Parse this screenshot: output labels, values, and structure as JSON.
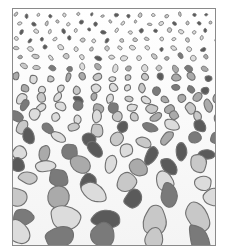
{
  "diagram": {
    "grading": {
      "top": "fine grains",
      "bottom": "coarse pebbles"
    },
    "palette": {
      "light": "#dcdcdc",
      "mid_light": "#c8c8c8",
      "mid": "#aaaaaa",
      "dark": "#7a7a7a",
      "darkest": "#5a5a5a",
      "outline": "#707070",
      "frame": "#8a8a8a"
    }
  }
}
